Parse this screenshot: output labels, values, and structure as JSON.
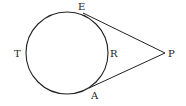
{
  "diagram": {
    "type": "circle with two tangent segments from external point",
    "circle": {
      "cx": 67,
      "cy": 53,
      "r": 41
    },
    "points": {
      "E": {
        "label": "E",
        "x": 83,
        "y": 13,
        "lx": 78,
        "ly": 10
      },
      "A": {
        "label": "A",
        "x": 89,
        "y": 88,
        "lx": 91,
        "ly": 99
      },
      "P": {
        "label": "P",
        "x": 165,
        "y": 53,
        "lx": 168,
        "ly": 57
      },
      "T": {
        "label": "T",
        "lx": 14,
        "ly": 57
      },
      "R": {
        "label": "R",
        "lx": 110,
        "ly": 57
      }
    },
    "segments": [
      {
        "from": "E",
        "to": "P"
      },
      {
        "from": "A",
        "to": "P"
      }
    ],
    "stroke_color": "#222222"
  }
}
